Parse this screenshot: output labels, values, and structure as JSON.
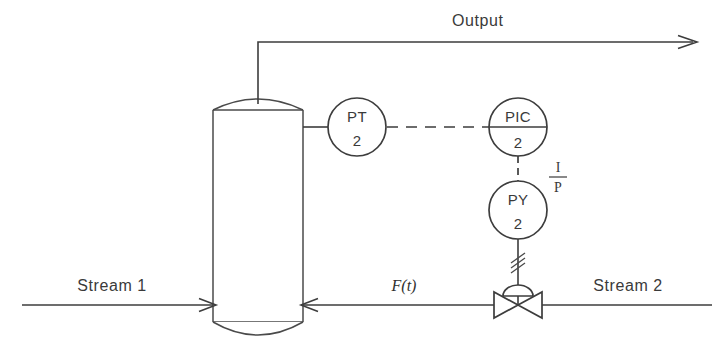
{
  "diagram": {
    "type": "process-and-instrumentation-diagram",
    "line_color": "#3d3d3d",
    "background_color": "#ffffff",
    "text_color": "#3a3a3a"
  },
  "labels": {
    "output": "Output",
    "stream_1": "Stream 1",
    "stream_2": "Stream 2",
    "flow_function": "F(t)",
    "transducer_numerator": "I",
    "transducer_denominator": "P"
  },
  "instruments": [
    {
      "id": "pt-2",
      "tag": "PT",
      "number": "2",
      "name": "pressure-transmitter",
      "divider_line": false,
      "cx": 357,
      "cy": 127,
      "r": 29
    },
    {
      "id": "pic-2",
      "tag": "PIC",
      "number": "2",
      "name": "pressure-indicating-controller",
      "divider_line": true,
      "cx": 518,
      "cy": 127,
      "r": 29
    },
    {
      "id": "py-2",
      "tag": "PY",
      "number": "2",
      "name": "pressure-transducer",
      "divider_line": false,
      "cx": 518,
      "cy": 210,
      "r": 29
    }
  ],
  "equipment": {
    "vessel": {
      "name": "vertical-vessel",
      "left": 213,
      "right": 303,
      "shell_top": 110,
      "shell_bottom": 322,
      "dome_height": 15
    },
    "control_valve": {
      "name": "pneumatic-control-valve",
      "cx": 518,
      "cy": 305,
      "actuator": "diaphragm"
    }
  },
  "signals": [
    {
      "from": "pt-2",
      "to": "pic-2",
      "kind": "electrical-dashed"
    },
    {
      "from": "pic-2",
      "to": "py-2",
      "kind": "electrical-dashed"
    },
    {
      "from": "py-2",
      "to": "control-valve",
      "kind": "pneumatic-hashed"
    }
  ],
  "streams": [
    {
      "name": "stream-1",
      "label": "Stream 1",
      "direction": "into-vessel",
      "side": "left"
    },
    {
      "name": "stream-2",
      "label": "Stream 2",
      "direction": "into-vessel",
      "side": "right"
    },
    {
      "name": "output",
      "label": "Output",
      "direction": "out-right",
      "side": "top"
    }
  ]
}
